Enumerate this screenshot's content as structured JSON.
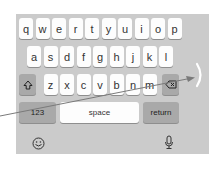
{
  "keyboard": {
    "row1": [
      "q",
      "w",
      "e",
      "r",
      "t",
      "y",
      "u",
      "i",
      "o",
      "p"
    ],
    "row2": [
      "a",
      "s",
      "d",
      "f",
      "g",
      "h",
      "j",
      "k",
      "l"
    ],
    "row3": [
      "z",
      "x",
      "c",
      "v",
      "b",
      "n",
      "m"
    ],
    "shift_icon": "shift-arrow-icon",
    "delete_icon": "backspace-icon",
    "numbers_label": "123",
    "space_label": "space",
    "return_label": "return",
    "emoji_icon": "emoji-smiley-icon",
    "mic_icon": "microphone-icon"
  },
  "overlay": {
    "arrow_icon": "gesture-arrow",
    "edge_indicator": ")"
  },
  "colors": {
    "keyboard_bg": "#cbcbcb",
    "key_light": "#fdfdfd",
    "key_dark": "#a9a9a9",
    "arrow": "#7a7a7a"
  }
}
